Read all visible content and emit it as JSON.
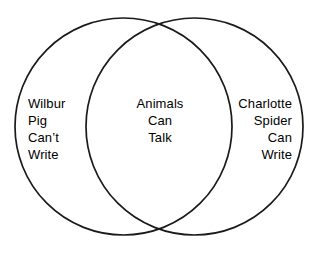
{
  "diagram": {
    "type": "venn-2-set",
    "background_color": "#ffffff",
    "stroke_color": "#1a1a1a",
    "text_color": "#000000",
    "left_set": {
      "name": "Wilbur",
      "lines": [
        "Wilbur",
        "Pig",
        "Can’t",
        "Write"
      ],
      "align": "left"
    },
    "intersection": {
      "name": "shared",
      "lines": [
        "Animals",
        "Can",
        "Talk"
      ],
      "align": "center"
    },
    "right_set": {
      "name": "Charlotte",
      "lines": [
        "Charlotte",
        "Spider",
        "Can",
        "Write"
      ],
      "align": "right"
    },
    "geometry": {
      "left_circle": {
        "cx": 123.5,
        "cy": 126.5,
        "r": 108.5
      },
      "right_circle": {
        "cx": 194.5,
        "cy": 126.5,
        "r": 108.5
      }
    }
  }
}
